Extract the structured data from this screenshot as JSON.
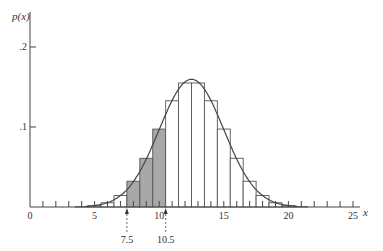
{
  "chart_data": {
    "type": "bar",
    "title": "",
    "xlabel": "x",
    "ylabel": "p(x)",
    "xlim": [
      0,
      26
    ],
    "ylim": [
      0,
      0.22
    ],
    "x_ticks": [
      0,
      5,
      10,
      15,
      20,
      25
    ],
    "x_tick_labels": [
      "0",
      "5",
      "10",
      "15",
      "20",
      "25"
    ],
    "y_ticks": [
      0.1,
      0.2
    ],
    "y_tick_labels": [
      ".1",
      ".2"
    ],
    "grid": false,
    "legend": null,
    "categories": [
      4,
      5,
      6,
      7,
      8,
      9,
      10,
      11,
      12,
      13,
      14,
      15,
      16,
      17,
      18,
      19,
      20,
      21
    ],
    "values": [
      0.0004,
      0.0016,
      0.0053,
      0.0143,
      0.0322,
      0.0609,
      0.0974,
      0.1328,
      0.155,
      0.155,
      0.1328,
      0.0974,
      0.0609,
      0.0322,
      0.0143,
      0.0053,
      0.0016,
      0.0004
    ],
    "shaded_interval": [
      7.5,
      10.5
    ],
    "shaded_color": "#a8a8a8",
    "normal_curve": {
      "mean": 12.5,
      "sd": 2.5
    },
    "annotations": [
      {
        "x": 7.5,
        "label": "7.5"
      },
      {
        "x": 10.5,
        "label": "10.5"
      }
    ]
  },
  "labels": {
    "y_axis": "p(x)",
    "x_axis": "x",
    "marker_left": "7.5",
    "marker_right": "10.5"
  }
}
